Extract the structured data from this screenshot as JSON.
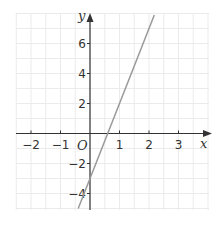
{
  "chart_data": {
    "type": "line",
    "title": "",
    "xlabel": "x",
    "ylabel": "y",
    "origin_label": "O",
    "xlim": [
      -2.5,
      3.9
    ],
    "ylim": [
      -5,
      8
    ],
    "x_ticks": [
      -2,
      -1,
      1,
      2,
      3
    ],
    "x_tick_labels": [
      "−2",
      "−1",
      "1",
      "2",
      "3"
    ],
    "y_ticks": [
      -4,
      -2,
      2,
      4,
      6
    ],
    "y_tick_labels": [
      "−4",
      "−2",
      "2",
      "4",
      "6"
    ],
    "grid": true,
    "series": [
      {
        "name": "y = 5x - 3",
        "equation": "y = 5x - 3",
        "x": [
          -0.4,
          2.18
        ],
        "y": [
          -5,
          7.9
        ],
        "color": "#999999"
      }
    ],
    "colors": {
      "grid": "#ebebeb",
      "axis": "#333333",
      "line": "#999999"
    }
  }
}
